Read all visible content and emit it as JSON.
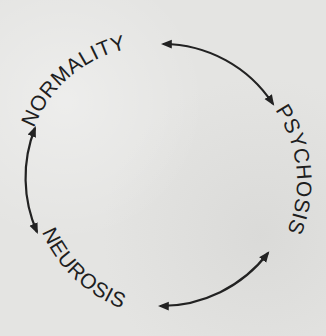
{
  "diagram": {
    "type": "cycle",
    "nodes": [
      {
        "id": "normality",
        "label": "NORMALITY"
      },
      {
        "id": "psychosis",
        "label": "PSYCHOSIS"
      },
      {
        "id": "neurosis",
        "label": "NEUROSIS"
      }
    ],
    "edges": [
      {
        "from": "normality",
        "to": "psychosis",
        "direction": "bidirectional"
      },
      {
        "from": "psychosis",
        "to": "neurosis",
        "direction": "bidirectional"
      },
      {
        "from": "neurosis",
        "to": "normality",
        "direction": "bidirectional"
      }
    ]
  },
  "colors": {
    "ink": "#1e1e1e",
    "paper": "#e4e4e2"
  }
}
